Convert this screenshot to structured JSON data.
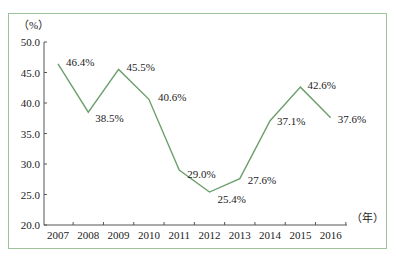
{
  "chart_data": {
    "type": "line",
    "title": "",
    "xlabel": "（年）",
    "ylabel": "（%）",
    "categories": [
      "2007",
      "2008",
      "2009",
      "2010",
      "2011",
      "2012",
      "2013",
      "2014",
      "2015",
      "2016"
    ],
    "series": [
      {
        "name": "rate",
        "values": [
          46.4,
          38.5,
          45.5,
          40.6,
          29.0,
          25.4,
          27.6,
          37.1,
          42.6,
          37.6
        ],
        "labels": [
          "46.4%",
          "38.5%",
          "45.5%",
          "40.6%",
          "29.0%",
          "25.4%",
          "27.6%",
          "37.1%",
          "42.6%",
          "37.6%"
        ],
        "color": "#6d9f6d"
      }
    ],
    "ylim": [
      20.0,
      50.0
    ],
    "yticks": [
      "20.0",
      "25.0",
      "30.0",
      "35.0",
      "40.0",
      "45.0",
      "50.0"
    ],
    "grid": false,
    "legend": "none"
  },
  "colors": {
    "frame_border": "#9cc59c",
    "line": "#6d9f6d",
    "axis": "#555555"
  }
}
